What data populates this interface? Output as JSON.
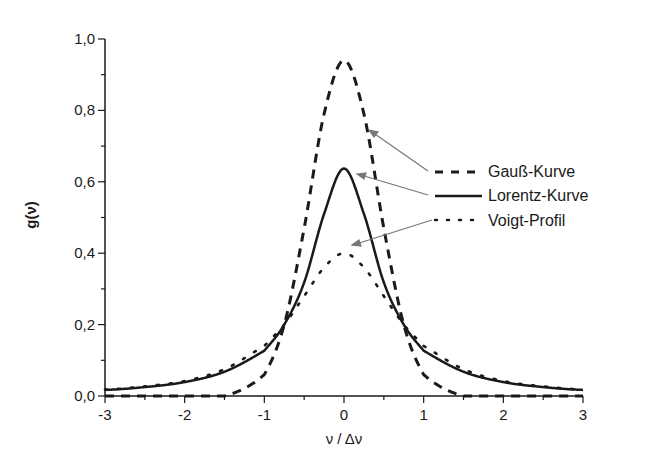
{
  "chart_data": {
    "type": "line",
    "title": "",
    "xlabel": "ν / Δν",
    "ylabel": "g(ν)",
    "xlim": [
      -3,
      3
    ],
    "ylim": [
      0,
      1.0
    ],
    "grid": false,
    "legend_position": "right-center",
    "x_ticks": [
      "-3",
      "-2",
      "-1",
      "0",
      "1",
      "2",
      "3"
    ],
    "y_ticks": [
      "0,0",
      "0,2",
      "0,4",
      "0,6",
      "0,8",
      "1,0"
    ],
    "x": [
      -3,
      -2.5,
      -2,
      -1.5,
      -1,
      -0.75,
      -0.5,
      -0.25,
      0,
      0.25,
      0.5,
      0.75,
      1,
      1.5,
      2,
      2.5,
      3
    ],
    "series": [
      {
        "name": "Gauß-Kurve",
        "style": "dashed",
        "peak": 0.94,
        "values": [
          0,
          0,
          0,
          0,
          0.06,
          0.2,
          0.47,
          0.79,
          0.94,
          0.79,
          0.47,
          0.2,
          0.06,
          0,
          0,
          0,
          0
        ]
      },
      {
        "name": "Lorentz-Kurve",
        "style": "solid",
        "peak": 0.64,
        "values": [
          0.017,
          0.025,
          0.039,
          0.068,
          0.127,
          0.2,
          0.318,
          0.51,
          0.637,
          0.51,
          0.318,
          0.2,
          0.127,
          0.068,
          0.039,
          0.025,
          0.017
        ]
      },
      {
        "name": "Voigt-Profil",
        "style": "dotted",
        "peak": 0.4,
        "values": [
          0.018,
          0.027,
          0.042,
          0.075,
          0.14,
          0.2,
          0.28,
          0.36,
          0.4,
          0.36,
          0.28,
          0.2,
          0.14,
          0.075,
          0.042,
          0.027,
          0.018
        ]
      }
    ],
    "annotations": [
      "arrows from legend entries to respective curves"
    ]
  },
  "axes": {
    "xlabel": "ν / Δν",
    "ylabel": "g(ν)",
    "x_ticks": [
      "-3",
      "-2",
      "-1",
      "0",
      "1",
      "2",
      "3"
    ],
    "y_ticks": [
      "0,0",
      "0,2",
      "0,4",
      "0,6",
      "0,8",
      "1,0"
    ]
  },
  "legend": {
    "items": [
      {
        "label": "Gauß-Kurve"
      },
      {
        "label": "Lorentz-Kurve"
      },
      {
        "label": "Voigt-Profil"
      }
    ]
  }
}
